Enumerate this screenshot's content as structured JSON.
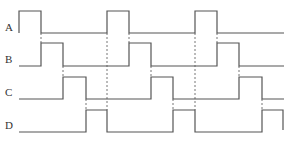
{
  "diagram": {
    "type": "timing-diagram",
    "colors": {
      "wave": "#555555",
      "guide": "#777777",
      "label": "#333333",
      "background": "#ffffff"
    },
    "signals": [
      {
        "name": "A",
        "label_y": 31,
        "high_y": 11,
        "low_y": 33,
        "points": "19,33 19,11 41,11 41,33 107,33 107,11 129,11 129,33 195,33 195,11 217,11 217,33 284,33"
      },
      {
        "name": "B",
        "label_y": 63,
        "high_y": 43,
        "low_y": 66,
        "points": "19,66 41,66 41,43 63,43 63,66 129,66 129,43 151,43 151,66 217,66 217,43 239,43 239,66 284,66"
      },
      {
        "name": "C",
        "label_y": 96,
        "high_y": 77,
        "low_y": 99,
        "points": "19,99 63,99 63,77 86,77 86,99 151,99 151,77 173,77 173,99 239,99 239,77 262,77 262,99 284,99"
      },
      {
        "name": "D",
        "label_y": 129,
        "high_y": 110,
        "low_y": 132,
        "points": "19,132 86,132 86,110 107,110 107,132 173,132 173,110 195,110 195,132 262,132 262,110 283,110 283,130"
      }
    ],
    "guides": [
      {
        "x": 41,
        "y1": 33,
        "y2": 43
      },
      {
        "x": 63,
        "y1": 66,
        "y2": 77
      },
      {
        "x": 86,
        "y1": 99,
        "y2": 110
      },
      {
        "x": 107,
        "y1": 33,
        "y2": 110
      },
      {
        "x": 129,
        "y1": 33,
        "y2": 43
      },
      {
        "x": 151,
        "y1": 66,
        "y2": 77
      },
      {
        "x": 173,
        "y1": 99,
        "y2": 110
      },
      {
        "x": 195,
        "y1": 33,
        "y2": 110
      },
      {
        "x": 217,
        "y1": 33,
        "y2": 43
      },
      {
        "x": 239,
        "y1": 66,
        "y2": 77
      },
      {
        "x": 262,
        "y1": 99,
        "y2": 110
      }
    ]
  }
}
